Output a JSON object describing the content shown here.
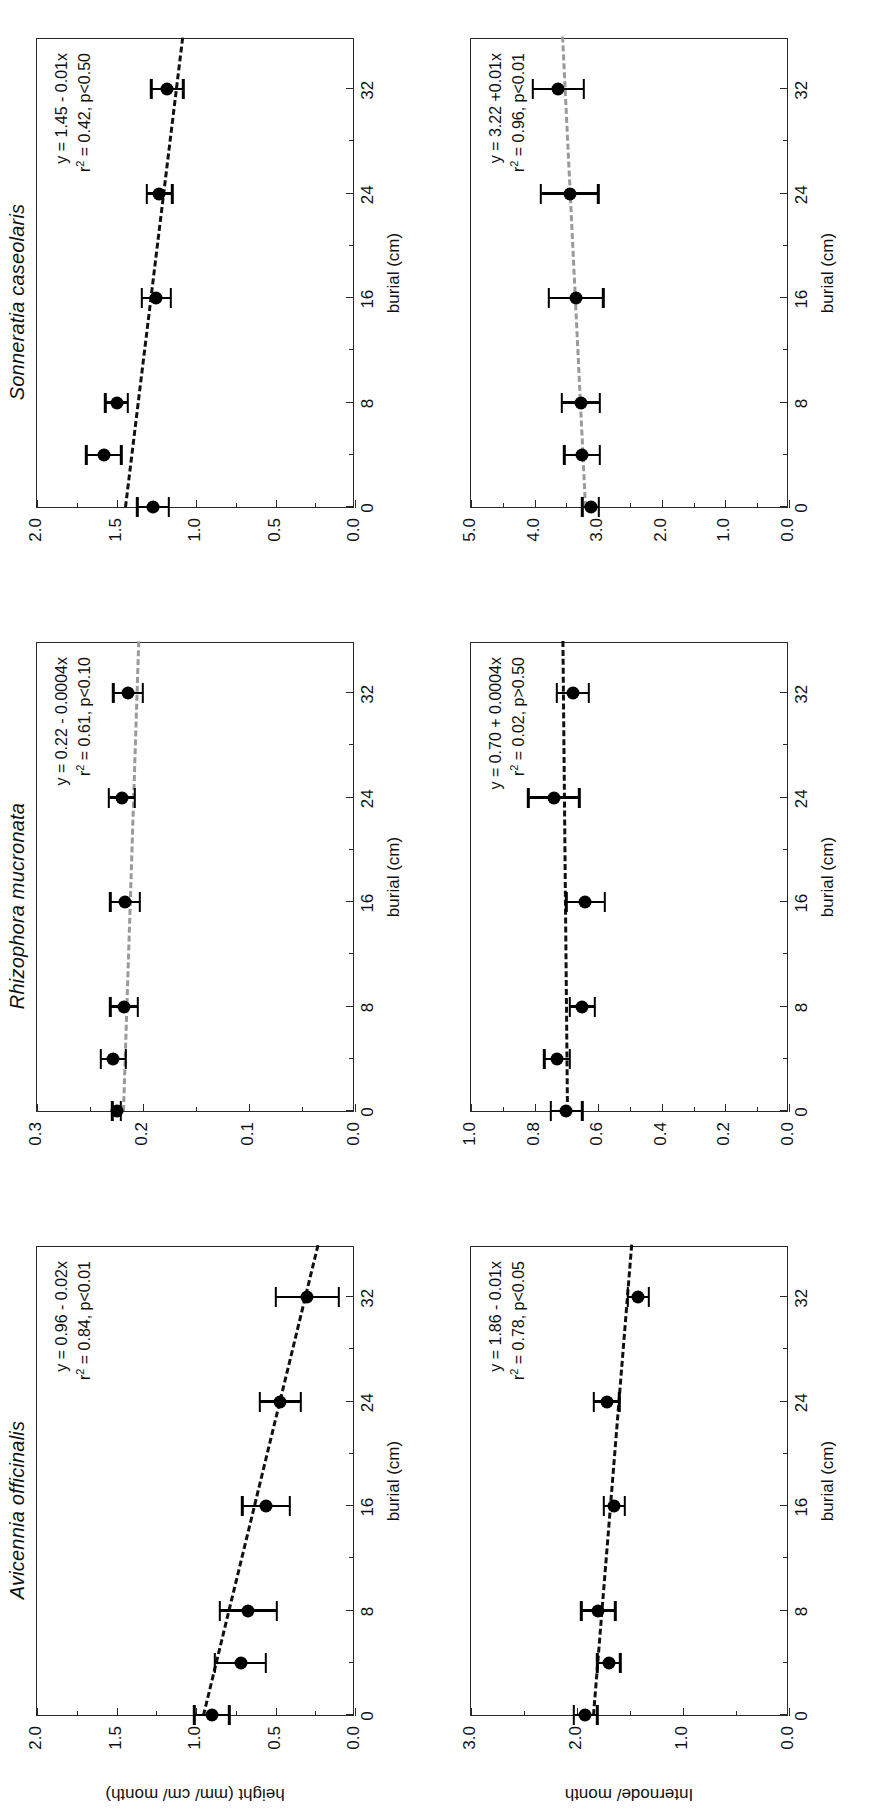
{
  "figure": {
    "panel_columns": [
      "Avicennia officinalis",
      "Rhizophora mucronata",
      "Sonneratia caseolaris"
    ],
    "x_axis_title": "burial (cm)",
    "row_y_titles": [
      "height (mm/ cm/ month)",
      "Internode/ month"
    ]
  },
  "chart_data": [
    {
      "id": "avicennia-height",
      "type": "scatter",
      "title": "Avicennia officinalis",
      "xlabel": "burial (cm)",
      "ylabel": "height (mm/ cm/ month)",
      "xlim": [
        0,
        36
      ],
      "ylim": [
        0.0,
        2.0
      ],
      "xticks": [
        0,
        8,
        16,
        24,
        32
      ],
      "xticklabels": [
        "0",
        "8",
        "16",
        "24",
        "32"
      ],
      "yticks": [
        0.0,
        0.5,
        1.0,
        1.5,
        2.0
      ],
      "yticklabels": [
        "0.0",
        "0.5",
        "1.0",
        "1.5",
        "2.0"
      ],
      "grid": false,
      "x": [
        0,
        4,
        8,
        16,
        24,
        32
      ],
      "y": [
        0.9,
        0.72,
        0.67,
        0.56,
        0.47,
        0.3
      ],
      "yerr": [
        0.11,
        0.16,
        0.18,
        0.15,
        0.13,
        0.2
      ],
      "fit": {
        "equation": "y = 0.96 - 0.02x",
        "r2_label": "r",
        "r2_sup": "2",
        "r2_text": " = 0.84, p<0.01",
        "intercept": 0.96,
        "slope": -0.02,
        "style": "dashed-dark"
      },
      "annotation_line1": "y = 0.96 - 0.02x",
      "annotation_line2": " = 0.84, p<0.01"
    },
    {
      "id": "rhizophora-height",
      "type": "scatter",
      "title": "Rhizophora mucronata",
      "xlabel": "burial (cm)",
      "ylabel": "height (mm/ cm/ month)",
      "xlim": [
        0,
        36
      ],
      "ylim": [
        0.0,
        0.3
      ],
      "xticks": [
        0,
        8,
        16,
        24,
        32
      ],
      "xticklabels": [
        "0",
        "8",
        "16",
        "24",
        "32"
      ],
      "yticks": [
        0.0,
        0.1,
        0.2,
        0.3
      ],
      "yticklabels": [
        "0.0",
        "0.1",
        "0.2",
        "0.3"
      ],
      "grid": false,
      "x": [
        0,
        4,
        8,
        16,
        24,
        32
      ],
      "y": [
        0.225,
        0.228,
        0.218,
        0.217,
        0.22,
        0.214
      ],
      "yerr": [
        0.004,
        0.012,
        0.013,
        0.014,
        0.012,
        0.014
      ],
      "fit": {
        "equation": "y = 0.22 - 0.0004x",
        "r2_label": "r",
        "r2_sup": "2",
        "r2_text": " = 0.61, p<0.10",
        "intercept": 0.22,
        "slope": -0.0004,
        "style": "dashed-light"
      },
      "annotation_line1": "y = 0.22 - 0.0004x",
      "annotation_line2": " = 0.61, p<0.10"
    },
    {
      "id": "sonneratia-height",
      "type": "scatter",
      "title": "Sonneratia caseolaris",
      "xlabel": "burial (cm)",
      "ylabel": "height (mm/ cm/ month)",
      "xlim": [
        0,
        36
      ],
      "ylim": [
        0.0,
        2.0
      ],
      "xticks": [
        0,
        8,
        16,
        24,
        32
      ],
      "xticklabels": [
        "0",
        "8",
        "16",
        "24",
        "32"
      ],
      "yticks": [
        0.0,
        0.5,
        1.0,
        1.5,
        2.0
      ],
      "yticklabels": [
        "0.0",
        "0.5",
        "1.0",
        "1.5",
        "2.0"
      ],
      "grid": false,
      "x": [
        0,
        4,
        8,
        16,
        24,
        32
      ],
      "y": [
        1.27,
        1.58,
        1.5,
        1.25,
        1.23,
        1.18
      ],
      "yerr": [
        0.1,
        0.11,
        0.07,
        0.09,
        0.08,
        0.1
      ],
      "fit": {
        "equation": "y = 1.45 - 0.01x",
        "r2_label": "r",
        "r2_sup": "2",
        "r2_text": " = 0.42, p<0.50",
        "intercept": 1.45,
        "slope": -0.01,
        "style": "dashed-dark"
      },
      "annotation_line1": "y = 1.45 - 0.01x",
      "annotation_line2": " = 0.42, p<0.50"
    },
    {
      "id": "avicennia-internode",
      "type": "scatter",
      "title": "Avicennia officinalis",
      "xlabel": "burial (cm)",
      "ylabel": "Internode/ month",
      "xlim": [
        0,
        36
      ],
      "ylim": [
        0.0,
        3.0
      ],
      "xticks": [
        0,
        8,
        16,
        24,
        32
      ],
      "xticklabels": [
        "0",
        "8",
        "16",
        "24",
        "32"
      ],
      "yticks": [
        0.0,
        1.0,
        2.0,
        3.0
      ],
      "yticklabels": [
        "0.0",
        "1.0",
        "2.0",
        "3.0"
      ],
      "grid": false,
      "x": [
        0,
        4,
        8,
        16,
        24,
        32
      ],
      "y": [
        1.92,
        1.7,
        1.8,
        1.65,
        1.72,
        1.42
      ],
      "yerr": [
        0.11,
        0.11,
        0.16,
        0.1,
        0.12,
        0.1
      ],
      "fit": {
        "equation": "y = 1.86 - 0.01x",
        "r2_label": "r",
        "r2_sup": "2",
        "r2_text": " = 0.78, p<0.05",
        "intercept": 1.86,
        "slope": -0.01,
        "style": "dashed-dark"
      },
      "annotation_line1": "y = 1.86 - 0.01x",
      "annotation_line2": " = 0.78, p<0.05"
    },
    {
      "id": "rhizophora-internode",
      "type": "scatter",
      "title": "Rhizophora mucronata",
      "xlabel": "burial (cm)",
      "ylabel": "Internode/ month",
      "xlim": [
        0,
        36
      ],
      "ylim": [
        0.0,
        1.0
      ],
      "xticks": [
        0,
        8,
        16,
        24,
        32
      ],
      "xticklabels": [
        "0",
        "8",
        "16",
        "24",
        "32"
      ],
      "yticks": [
        0.0,
        0.2,
        0.4,
        0.6,
        0.8,
        1.0
      ],
      "yticklabels": [
        "0.0",
        "0.2",
        "0.4",
        "0.6",
        "0.8",
        "1.0"
      ],
      "grid": false,
      "x": [
        0,
        4,
        8,
        16,
        24,
        32
      ],
      "y": [
        0.7,
        0.73,
        0.65,
        0.64,
        0.74,
        0.68
      ],
      "yerr": [
        0.05,
        0.04,
        0.04,
        0.06,
        0.08,
        0.05
      ],
      "fit": {
        "equation": "y = 0.70 + 0.0004x",
        "r2_label": "r",
        "r2_sup": "2",
        "r2_text": " = 0.02, p>0.50",
        "intercept": 0.7,
        "slope": 0.0004,
        "style": "dashed-dark"
      },
      "annotation_line1": "y = 0.70 + 0.0004x",
      "annotation_line2": " = 0.02, p>0.50"
    },
    {
      "id": "sonneratia-internode",
      "type": "scatter",
      "title": "Sonneratia caseolaris",
      "xlabel": "burial (cm)",
      "ylabel": "Internode/ month",
      "xlim": [
        0,
        36
      ],
      "ylim": [
        0.0,
        5.0
      ],
      "xticks": [
        0,
        8,
        16,
        24,
        32
      ],
      "xticklabels": [
        "0",
        "8",
        "16",
        "24",
        "32"
      ],
      "yticks": [
        0.0,
        1.0,
        2.0,
        3.0,
        4.0,
        5.0
      ],
      "yticklabels": [
        "0.0",
        "1.0",
        "2.0",
        "3.0",
        "4.0",
        "5.0"
      ],
      "grid": false,
      "x": [
        0,
        4,
        8,
        16,
        24,
        32
      ],
      "y": [
        3.12,
        3.25,
        3.27,
        3.35,
        3.45,
        3.63
      ],
      "yerr": [
        0.13,
        0.28,
        0.3,
        0.43,
        0.45,
        0.4
      ],
      "fit": {
        "equation": "y = 3.22 +0.01x",
        "r2_label": "r",
        "r2_sup": "2",
        "r2_text": " = 0.96, p<0.01",
        "intercept": 3.22,
        "slope": 0.01,
        "style": "dashed-light"
      },
      "annotation_line1": "y = 3.22 +0.01x",
      "annotation_line2": " = 0.96, p<0.01"
    }
  ]
}
